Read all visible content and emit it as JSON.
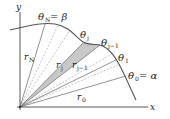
{
  "diagram": {
    "type": "polar-area-sectors",
    "axes": {
      "x_label": "x",
      "y_label": "y"
    },
    "angle_labels": {
      "theta_N": {
        "sym": "θ",
        "sub": "N",
        "suffix": " = β"
      },
      "theta_j": {
        "sym": "θ",
        "sub": "j",
        "suffix": ""
      },
      "theta_j_minus_1": {
        "sym": "θ",
        "sub": "j−1",
        "suffix": ""
      },
      "theta_1": {
        "sym": "θ",
        "sub": "1",
        "suffix": ""
      },
      "theta_0": {
        "sym": "θ",
        "sub": "0",
        "suffix": " = α"
      }
    },
    "radius_labels": {
      "r_N": {
        "sym": "r",
        "sub": "N"
      },
      "r_j": {
        "sym": "r",
        "sub": "j"
      },
      "r_j_minus_1": {
        "sym": "r",
        "sub": "j−1"
      },
      "r_0": {
        "sym": "r",
        "sub": "0"
      }
    },
    "colors": {
      "curve": "#555555",
      "axes": "#444444",
      "rays": "#777777",
      "dashed_rays": "#aaaaaa",
      "shaded_sector": "#c8c8c8"
    }
  }
}
